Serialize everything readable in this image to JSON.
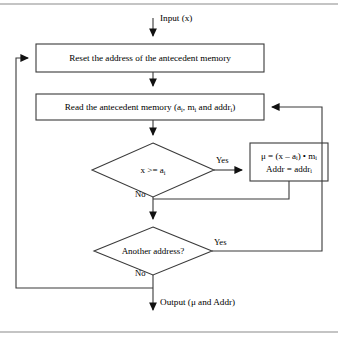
{
  "figure": {
    "colors": {
      "stroke": "#3a3a3a",
      "text": "#000000",
      "background": "#ffffff",
      "rule": "#8a8a8a"
    }
  },
  "io": {
    "input_label": "Input (x)",
    "output_label": "Output (μ and Addr)"
  },
  "nodes": {
    "reset_box": {
      "type": "process",
      "text": "Reset the address of the antecedent memory"
    },
    "read_box": {
      "type": "process",
      "text_prefix": "Read the antecedent memory (a",
      "sub1": "i",
      "text_mid": ", m",
      "sub2": "i",
      "text_mid2": " and addr",
      "sub3": "i",
      "text_suffix": ")"
    },
    "compare_diamond": {
      "type": "decision",
      "text_prefix": "x >= a",
      "sub": "i"
    },
    "formula_box": {
      "type": "process",
      "line1_prefix": "μ = (x – a",
      "line1_sub1": "i",
      "line1_mid": ") • m",
      "line1_sub2": "i",
      "line2_prefix": "Addr = addr",
      "line2_sub": "i"
    },
    "another_diamond": {
      "type": "decision",
      "text": "Another address?"
    }
  },
  "edges": {
    "compare_yes": "Yes",
    "compare_no": "No",
    "another_yes": "Yes",
    "another_no": "No"
  }
}
